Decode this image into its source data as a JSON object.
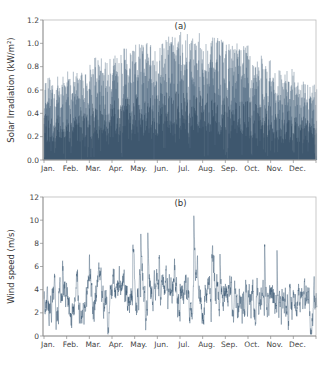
{
  "chart_data": [
    {
      "type": "bar",
      "panel_label": "(a)",
      "title": "",
      "xlabel": "",
      "ylabel": "Solar Irradiation (kW/m²)",
      "ylim": [
        0,
        1.2
      ],
      "yticks": [
        "0.0",
        "0.2",
        "0.4",
        "0.6",
        "0.8",
        "1.0",
        "1.2"
      ],
      "categories": [
        "Jan.",
        "Feb.",
        "Mar.",
        "Apr.",
        "May.",
        "Jun.",
        "Jul.",
        "Aug.",
        "Sep.",
        "Oct.",
        "Nov.",
        "Dec."
      ],
      "monthly_peak": [
        0.72,
        0.78,
        0.88,
        0.97,
        1.02,
        1.08,
        1.1,
        1.05,
        1.0,
        0.9,
        0.78,
        0.68
      ],
      "resolution": "hourly",
      "grid": false,
      "legend": "none",
      "color": "#2f4f6b"
    },
    {
      "type": "line",
      "panel_label": "(b)",
      "title": "",
      "xlabel": "",
      "ylabel": "Wind speed (m/s)",
      "ylim": [
        0,
        12
      ],
      "yticks": [
        "0",
        "2",
        "4",
        "6",
        "8",
        "10",
        "12"
      ],
      "categories": [
        "Jan.",
        "Feb.",
        "Mar.",
        "Apr.",
        "May.",
        "Jun.",
        "Jul.",
        "Aug.",
        "Sep.",
        "Oct.",
        "Nov.",
        "Dec."
      ],
      "monthly_mean": [
        2.6,
        2.7,
        3.0,
        3.2,
        3.3,
        3.6,
        3.7,
        3.6,
        3.3,
        3.0,
        2.9,
        2.7
      ],
      "monthly_max": [
        6.5,
        6.8,
        9.1,
        9.0,
        9.7,
        9.6,
        10.9,
        9.5,
        9.2,
        8.5,
        7.8,
        7.2
      ],
      "resolution": "hourly",
      "grid": false,
      "legend": "none",
      "color": "#2f4f6b"
    }
  ]
}
